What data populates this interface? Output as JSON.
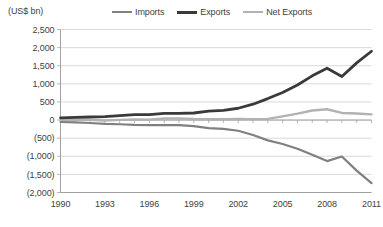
{
  "axis_unit_label": "(US$ bn)",
  "legend": {
    "position": "top-center",
    "items": [
      {
        "label": "Imports",
        "color": "#808080",
        "swatch": "line-swatch-icon"
      },
      {
        "label": "Exports",
        "color": "#3a3a3a",
        "swatch": "line-swatch-icon"
      },
      {
        "label": "Net Exports",
        "color": "#b2b2b2",
        "swatch": "line-swatch-icon"
      }
    ]
  },
  "chart_data": {
    "type": "line",
    "title": "",
    "subtitle": "",
    "xlabel": "",
    "ylabel": "(US$ bn)",
    "grid": true,
    "legend_position": "top-center",
    "xlim": [
      1990,
      2011
    ],
    "ylim": [
      -2000,
      2500
    ],
    "ytick_values": [
      2500,
      2000,
      1500,
      1000,
      500,
      0,
      -500,
      -1000,
      -1500,
      -2000
    ],
    "ytick_labels": [
      "2,500",
      "2,000",
      "1,500",
      "1,000",
      "500",
      "0",
      "(500)",
      "(1,000)",
      "(1,500)",
      "(2,000)"
    ],
    "xtick_values": [
      1990,
      1993,
      1996,
      1999,
      2002,
      2005,
      2008,
      2011
    ],
    "xtick_labels": [
      "1990",
      "1993",
      "1996",
      "1999",
      "2002",
      "2005",
      "2008",
      "2011"
    ],
    "x": [
      1990,
      1991,
      1992,
      1993,
      1994,
      1995,
      1996,
      1997,
      1998,
      1999,
      2000,
      2001,
      2002,
      2003,
      2004,
      2005,
      2006,
      2007,
      2008,
      2009,
      2010,
      2011
    ],
    "series": [
      {
        "name": "Exports",
        "color": "#3a3a3a",
        "values": [
          62,
          72,
          85,
          92,
          121,
          149,
          151,
          183,
          184,
          195,
          249,
          266,
          326,
          438,
          593,
          762,
          969,
          1220,
          1431,
          1202,
          1578,
          1899
        ]
      },
      {
        "name": "Imports",
        "color": "#808080",
        "values": [
          -53,
          -64,
          -81,
          -104,
          -116,
          -132,
          -139,
          -142,
          -140,
          -166,
          -225,
          -244,
          -295,
          -413,
          -561,
          -660,
          -792,
          -956,
          -1133,
          -1006,
          -1396,
          -1743
        ]
      },
      {
        "name": "Net Exports",
        "color": "#b2b2b2",
        "values": [
          9,
          8,
          4,
          -12,
          5,
          17,
          12,
          41,
          44,
          29,
          24,
          22,
          31,
          25,
          32,
          102,
          177,
          264,
          298,
          196,
          182,
          156
        ]
      }
    ]
  }
}
